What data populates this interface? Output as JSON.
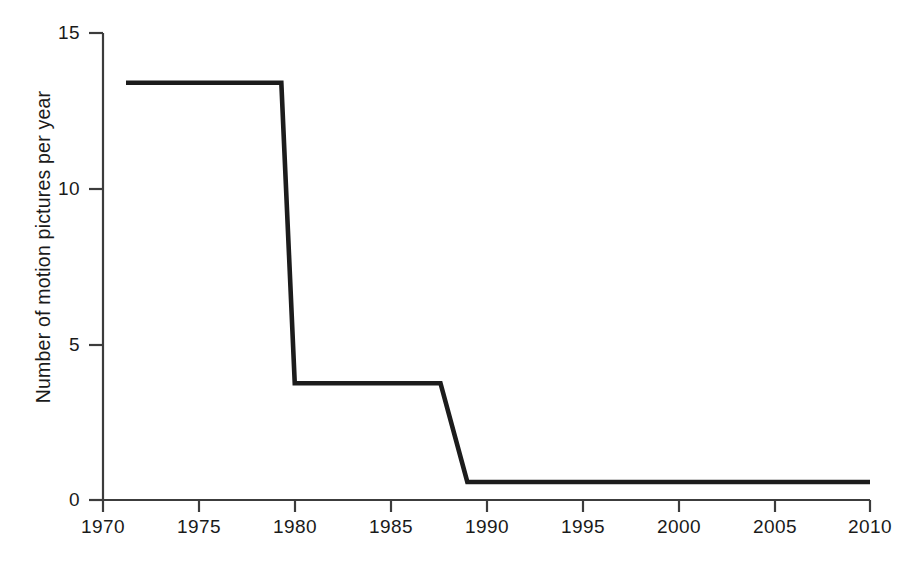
{
  "chart_data": {
    "type": "line",
    "title": "",
    "xlabel": "",
    "ylabel": "Number of motion pictures per year",
    "xlim": [
      1970,
      2010
    ],
    "ylim": [
      0,
      15
    ],
    "grid": false,
    "legend": null,
    "line_style": "step-like piecewise linear with steep transitions",
    "line_color": "#1c1c1c",
    "axis_color": "#3c3c3c",
    "x_ticks": [
      1970,
      1975,
      1980,
      1985,
      1990,
      1995,
      2000,
      2005,
      2010
    ],
    "x_tick_labels": [
      "1970",
      "1975",
      "1980",
      "1985",
      "1990",
      "1995",
      "2000",
      "2005",
      "2010"
    ],
    "y_ticks": [
      0,
      5,
      10,
      15
    ],
    "y_tick_labels": [
      "0",
      "5",
      "10",
      "15"
    ],
    "series": [
      {
        "name": "Number of motion pictures per year",
        "x": [
          1971.2,
          1979.3,
          1980.0,
          1987.6,
          1989.0,
          2010.0
        ],
        "values": [
          13.4,
          13.4,
          3.75,
          3.75,
          0.58,
          0.58
        ]
      }
    ],
    "segments": [
      {
        "label": "high plateau",
        "x_start": 1971.2,
        "x_end": 1979.3,
        "value": 13.4
      },
      {
        "label": "first decline",
        "x_start": 1979.3,
        "x_end": 1980.0,
        "value_from": 13.4,
        "value_to": 3.75
      },
      {
        "label": "middle plateau",
        "x_start": 1980.0,
        "x_end": 1987.6,
        "value": 3.75
      },
      {
        "label": "second decline",
        "x_start": 1987.6,
        "x_end": 1989.0,
        "value_from": 3.75,
        "value_to": 0.58
      },
      {
        "label": "low plateau",
        "x_start": 1989.0,
        "x_end": 2010.0,
        "value": 0.58
      }
    ]
  }
}
